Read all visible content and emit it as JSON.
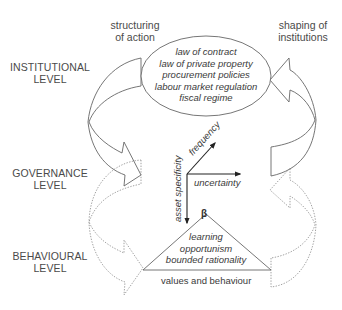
{
  "top_labels": {
    "left": [
      "structuring",
      "of action"
    ],
    "right": [
      "shaping of",
      "institutions"
    ]
  },
  "levels": [
    {
      "name": "institutional",
      "lines": [
        "INSTITUTIONAL",
        "LEVEL"
      ]
    },
    {
      "name": "governance",
      "lines": [
        "GOVERNANCE",
        "LEVEL"
      ]
    },
    {
      "name": "behavioural",
      "lines": [
        "BEHAVIOURAL",
        "LEVEL"
      ]
    }
  ],
  "institutions_ellipse": {
    "items": [
      "law of contract",
      "law of private property",
      "procurement  policies",
      "labour market regulation",
      "fiscal regime"
    ]
  },
  "governance_axes": {
    "vertical": "asset specificity",
    "diagonal": "frequency",
    "horizontal": "uncertainty"
  },
  "behaviour_triangle": {
    "apex_symbol": "β",
    "items": [
      "learning",
      "opportunism",
      "bounded rationality"
    ],
    "base_label": "values and behaviour"
  },
  "colors": {
    "line": "#555555",
    "dotted_line": "#8a8a8a",
    "text": "#444444"
  }
}
